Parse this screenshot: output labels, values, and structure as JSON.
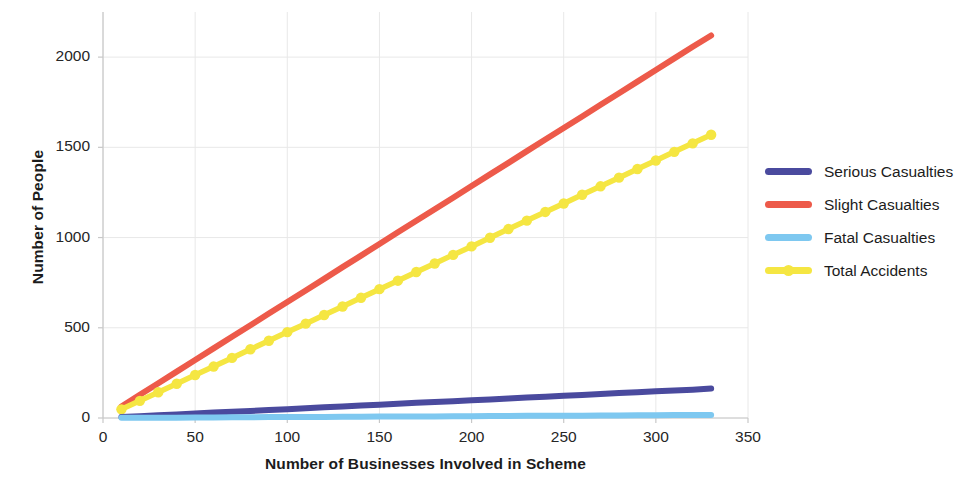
{
  "chart_data": {
    "type": "line",
    "title": "",
    "xlabel": "Number of Businesses Involved in Scheme",
    "ylabel": "Number of People",
    "xlim": [
      0,
      350
    ],
    "ylim": [
      0,
      2250
    ],
    "xticks": [
      0,
      50,
      100,
      150,
      200,
      250,
      300,
      350
    ],
    "yticks": [
      0,
      500,
      1000,
      1500,
      2000
    ],
    "grid": true,
    "legend_position": "right",
    "x": [
      10,
      20,
      30,
      40,
      50,
      60,
      70,
      80,
      90,
      100,
      110,
      120,
      130,
      140,
      150,
      160,
      170,
      180,
      190,
      200,
      210,
      220,
      230,
      240,
      250,
      260,
      270,
      280,
      290,
      300,
      310,
      320,
      330
    ],
    "series": [
      {
        "name": "Serious Casualties",
        "color": "#4a4a9e",
        "marker": "none",
        "values": [
          5,
          10,
          15,
          20,
          25,
          30,
          34,
          39,
          44,
          49,
          54,
          59,
          64,
          69,
          74,
          79,
          84,
          88,
          93,
          98,
          103,
          108,
          113,
          118,
          123,
          128,
          133,
          138,
          143,
          148,
          152,
          157,
          163
        ]
      },
      {
        "name": "Slight Casualties",
        "color": "#ed5a4a",
        "marker": "none",
        "values": [
          64,
          129,
          193,
          257,
          321,
          386,
          450,
          514,
          579,
          643,
          707,
          771,
          836,
          900,
          964,
          1029,
          1093,
          1157,
          1221,
          1286,
          1350,
          1414,
          1479,
          1543,
          1607,
          1671,
          1736,
          1800,
          1864,
          1929,
          1993,
          2057,
          2120
        ]
      },
      {
        "name": "Fatal Casualties",
        "color": "#7ec8f0",
        "marker": "none",
        "values": [
          1,
          1,
          2,
          2,
          3,
          3,
          4,
          4,
          5,
          5,
          6,
          6,
          7,
          7,
          8,
          8,
          9,
          9,
          10,
          10,
          11,
          11,
          12,
          12,
          13,
          13,
          14,
          14,
          15,
          15,
          16,
          16,
          17
        ]
      },
      {
        "name": "Total Accidents",
        "color": "#f5e642",
        "marker": "circle",
        "values": [
          48,
          95,
          143,
          190,
          238,
          285,
          333,
          381,
          428,
          476,
          523,
          571,
          618,
          666,
          714,
          761,
          809,
          856,
          904,
          951,
          999,
          1047,
          1094,
          1142,
          1189,
          1237,
          1284,
          1332,
          1380,
          1427,
          1475,
          1522,
          1570
        ]
      }
    ]
  },
  "legend": {
    "items": [
      {
        "label": "Serious Casualties",
        "color": "#4a4a9e",
        "marker": "none"
      },
      {
        "label": "Slight Casualties",
        "color": "#ed5a4a",
        "marker": "none"
      },
      {
        "label": "Fatal Casualties",
        "color": "#7ec8f0",
        "marker": "none"
      },
      {
        "label": "Total Accidents",
        "color": "#f5e642",
        "marker": "circle"
      }
    ]
  },
  "axes": {
    "x_title": "Number of Businesses Involved in Scheme",
    "y_title": "Number of People",
    "x_tick_labels": [
      "0",
      "50",
      "100",
      "150",
      "200",
      "250",
      "300",
      "350"
    ],
    "y_tick_labels": [
      "0",
      "500",
      "1000",
      "1500",
      "2000"
    ]
  },
  "colors": {
    "grid": "#e8e8e8",
    "axis": "#c8c8c8",
    "text": "#1c1c1c"
  }
}
